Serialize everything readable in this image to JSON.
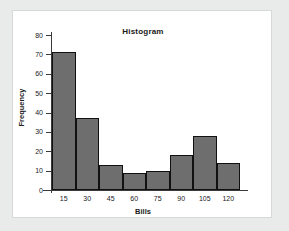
{
  "chart_data": {
    "type": "bar",
    "title": "Histogram",
    "xlabel": "Bills",
    "ylabel": "Frequency",
    "categories": [
      "15",
      "30",
      "45",
      "60",
      "75",
      "90",
      "105",
      "120"
    ],
    "values": [
      71,
      37,
      13,
      9,
      10,
      18,
      28,
      14
    ],
    "ylim": [
      0,
      80
    ],
    "yticks": [
      0,
      10,
      20,
      30,
      40,
      50,
      60,
      70,
      80
    ],
    "ytick_labels": [
      "0",
      "10",
      "20",
      "30",
      "40",
      "50",
      "60",
      "70",
      "80"
    ],
    "grid": false,
    "legend": null,
    "bar_fill_color": "#6e6e6e",
    "bar_edge_color": "#111111",
    "axis_color": "#3a3a3a",
    "panel_background": "#ffffff",
    "page_background": "#e9eaea"
  }
}
